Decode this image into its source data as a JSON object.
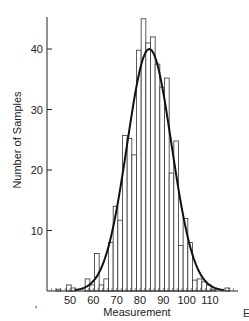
{
  "chart_data": {
    "type": "bar",
    "subtype": "histogram_with_normal_fit",
    "title": "",
    "xlabel": "Measurement",
    "ylabel": "Number of Samples",
    "xlim": [
      40,
      122
    ],
    "ylim": [
      0,
      45
    ],
    "x_ticks": [
      50,
      60,
      70,
      80,
      90,
      100,
      110
    ],
    "y_ticks": [
      10,
      20,
      30,
      40
    ],
    "grid": false,
    "legend": null,
    "bin_width": 2,
    "bins": [
      {
        "x": 45,
        "value": 0.3
      },
      {
        "x": 49.5,
        "value": 1.0
      },
      {
        "x": 51.5,
        "value": 0.5
      },
      {
        "x": 57.5,
        "value": 2.0
      },
      {
        "x": 59.5,
        "value": 1.0
      },
      {
        "x": 61.5,
        "value": 6.2
      },
      {
        "x": 63.5,
        "value": 1.0
      },
      {
        "x": 65.5,
        "value": 2.0
      },
      {
        "x": 67.5,
        "value": 8.0
      },
      {
        "x": 69.5,
        "value": 14.0
      },
      {
        "x": 71.5,
        "value": 11.7
      },
      {
        "x": 73.5,
        "value": 25.7
      },
      {
        "x": 75.5,
        "value": 25.2
      },
      {
        "x": 77.5,
        "value": 22.5
      },
      {
        "x": 79.5,
        "value": 39.8
      },
      {
        "x": 81.5,
        "value": 45.0
      },
      {
        "x": 83.5,
        "value": 41.0
      },
      {
        "x": 85.5,
        "value": 42.0
      },
      {
        "x": 87.5,
        "value": 37.5
      },
      {
        "x": 89.5,
        "value": 33.7
      },
      {
        "x": 91.5,
        "value": 35.2
      },
      {
        "x": 93.5,
        "value": 19.5
      },
      {
        "x": 95.5,
        "value": 24.8
      },
      {
        "x": 97.5,
        "value": 7.5
      },
      {
        "x": 99.5,
        "value": 12.0
      },
      {
        "x": 101.5,
        "value": 8.0
      },
      {
        "x": 103.5,
        "value": 1.8
      },
      {
        "x": 105.5,
        "value": 2.0
      },
      {
        "x": 107.5,
        "value": 1.5
      },
      {
        "x": 109.5,
        "value": 1.0
      },
      {
        "x": 111.5,
        "value": 0.3
      },
      {
        "x": 117.5,
        "value": 0.5
      }
    ],
    "fit_curve": {
      "type": "normal",
      "mean": 84,
      "std": 9.5,
      "peak": 40
    }
  },
  "stray_marks": {
    "left_mark": "'",
    "right_clipped": "E"
  }
}
